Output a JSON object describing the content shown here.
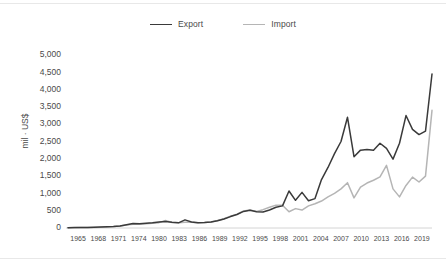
{
  "chart_data": {
    "type": "line",
    "title": "",
    "xlabel": "",
    "ylabel": "mil · US$",
    "ylim": [
      0,
      5000
    ],
    "ytick_labels": [
      "5,000",
      "4,500",
      "4,000",
      "3,500",
      "3,000",
      "2,500",
      "2,000",
      "1,500",
      "1,000",
      "500",
      "0"
    ],
    "ytick_values": [
      5000,
      4500,
      4000,
      3500,
      3000,
      2500,
      2000,
      1500,
      1000,
      500,
      0
    ],
    "xtick_labels": [
      "1965",
      "1968",
      "1971",
      "1974",
      "1980",
      "1983",
      "1986",
      "1989",
      "1992",
      "1995",
      "1998",
      "2001",
      "2004",
      "2007",
      "2010",
      "2013",
      "2016",
      "2019"
    ],
    "grid": false,
    "legend_position": "top-center",
    "x": [
      1965,
      1966,
      1967,
      1968,
      1969,
      1970,
      1971,
      1972,
      1973,
      1974,
      1975,
      1976,
      1977,
      1978,
      1979,
      1980,
      1981,
      1982,
      1983,
      1984,
      1985,
      1986,
      1987,
      1988,
      1989,
      1990,
      1991,
      1992,
      1993,
      1994,
      1995,
      1996,
      1997,
      1998,
      1999,
      2000,
      2001,
      2002,
      2003,
      2004,
      2005,
      2006,
      2007,
      2008,
      2009,
      2010,
      2011,
      2012,
      2013,
      2014,
      2015,
      2016,
      2017,
      2018,
      2019,
      2020,
      2021
    ],
    "series": [
      {
        "name": "Export",
        "color": "#3a3a3a",
        "values": [
          10,
          12,
          14,
          18,
          22,
          28,
          35,
          45,
          60,
          95,
          130,
          120,
          135,
          150,
          170,
          185,
          165,
          150,
          235,
          175,
          150,
          160,
          175,
          210,
          260,
          330,
          390,
          480,
          510,
          470,
          460,
          520,
          600,
          640,
          1070,
          800,
          1030,
          790,
          850,
          1400,
          1750,
          2150,
          2500,
          3200,
          2060,
          2250,
          2270,
          2250,
          2450,
          2300,
          1990,
          2450,
          3250,
          2850,
          2700,
          2800,
          4450
        ]
      },
      {
        "name": "Import",
        "color": "#b5b5b5",
        "values": [
          8,
          10,
          12,
          15,
          18,
          24,
          30,
          40,
          55,
          85,
          110,
          105,
          120,
          135,
          155,
          215,
          160,
          150,
          165,
          165,
          150,
          160,
          175,
          215,
          270,
          340,
          400,
          490,
          520,
          480,
          530,
          600,
          660,
          660,
          470,
          560,
          520,
          640,
          700,
          780,
          900,
          1000,
          1130,
          1310,
          870,
          1180,
          1300,
          1380,
          1480,
          1810,
          1130,
          900,
          1230,
          1470,
          1330,
          1500,
          3400
        ]
      }
    ]
  },
  "legend": {
    "entries": [
      {
        "label": "Export"
      },
      {
        "label": "Import"
      }
    ]
  }
}
